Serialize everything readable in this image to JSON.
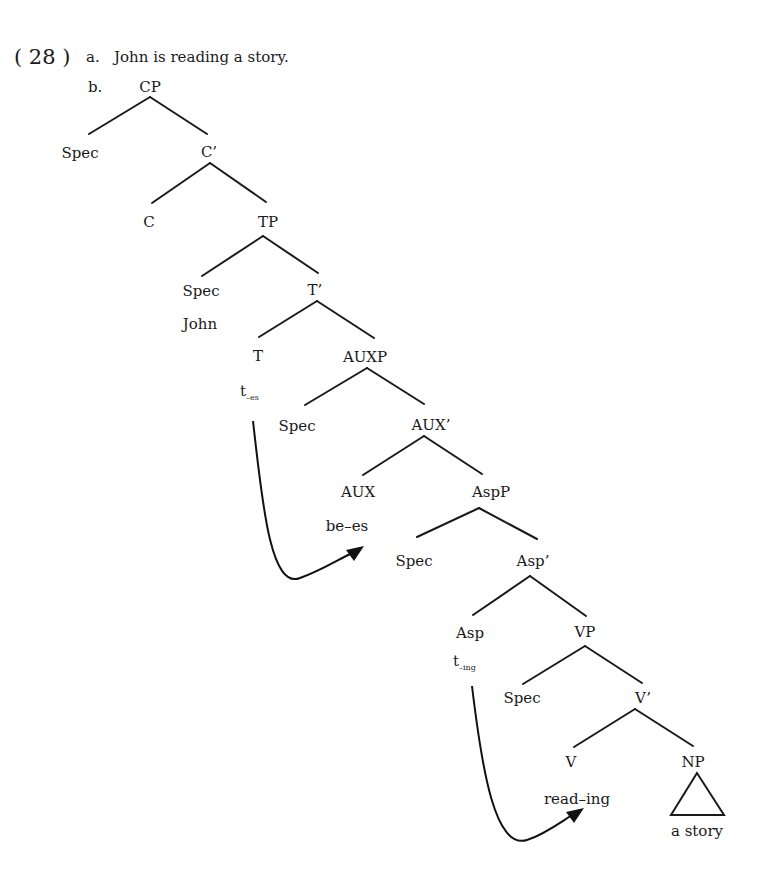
{
  "example": {
    "number": "( 28 )",
    "a_label": "a.",
    "a_sentence": "John is reading a story.",
    "b_label": "b."
  },
  "tree": {
    "CP": "CP",
    "CP_spec": "Spec",
    "C_bar": "C’",
    "C": "C",
    "TP": "TP",
    "TP_spec": "Spec",
    "TP_spec_word": "John",
    "T_bar": "T’",
    "T": "T",
    "T_trace_base": "t",
    "T_trace_sub": "–es",
    "AUXP": "AUXP",
    "AUXP_spec": "Spec",
    "AUX_bar": "AUX’",
    "AUX": "AUX",
    "AUX_word": "be–es",
    "AspP": "AspP",
    "AspP_spec": "Spec",
    "Asp_bar": "Asp’",
    "Asp": "Asp",
    "Asp_trace_base": "t",
    "Asp_trace_sub": "–ing",
    "VP": "VP",
    "VP_spec": "Spec",
    "V_bar": "V’",
    "V": "V",
    "V_word": "read–ing",
    "NP": "NP",
    "NP_word": "a story"
  },
  "movements": [
    {
      "from": "t–es",
      "to": "be–es"
    },
    {
      "from": "t–ing",
      "to": "read–ing"
    }
  ],
  "colors": {
    "ink": "#1a1a1a",
    "background": "#ffffff"
  }
}
